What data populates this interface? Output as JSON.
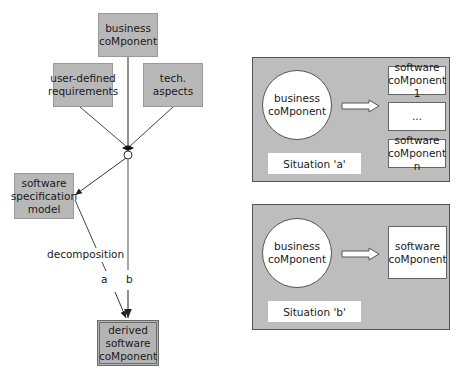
{
  "left_diagram": {
    "business_component": "business\ncoMponent",
    "user_defined_requirements": "user-defined\nrequirements",
    "tech_aspects": "tech.\naspects",
    "software_specification_model": "software\nspecification\nmodel",
    "decomposition_label": "decomposition",
    "path_a_label": "a",
    "path_b_label": "b",
    "derived_software_component": "derived\nsoftware\ncoMponent"
  },
  "situation_a": {
    "business_component": "business\ncoMponent",
    "software_component_1": "software\ncoMponent 1",
    "ellipsis": "...",
    "software_component_n": "software\ncoMponent n",
    "caption": "Situation 'a'"
  },
  "situation_b": {
    "business_component": "business\ncoMponent",
    "software_component": "software\ncoMponent",
    "caption": "Situation 'b'"
  },
  "colors": {
    "box_fill": "#b8b8b8",
    "panel_fill": "#bdbdbd",
    "line": "#333333",
    "white": "#ffffff"
  }
}
